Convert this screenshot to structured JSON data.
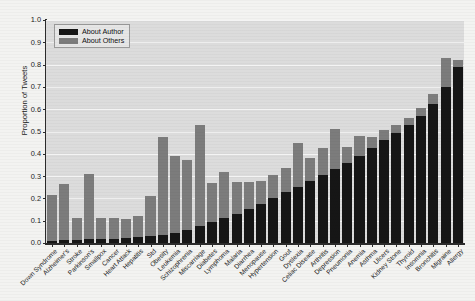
{
  "chart_data": {
    "type": "bar",
    "stacked": true,
    "title": "",
    "xlabel": "",
    "ylabel": "Proportion of Tweets",
    "ylim": [
      0.0,
      1.0
    ],
    "ytick_labels": [
      "0.0",
      "0.1",
      "0.2",
      "0.3",
      "0.4",
      "0.5",
      "0.6",
      "0.7",
      "0.8",
      "0.9",
      "1.0"
    ],
    "ytick_values": [
      0.0,
      0.1,
      0.2,
      0.3,
      0.4,
      0.5,
      0.6,
      0.7,
      0.8,
      0.9,
      1.0
    ],
    "grid": true,
    "legend_position": "upper left",
    "colors": {
      "about_author": "#161616",
      "about_others": "#7c7c7c",
      "plot_background": "#dcdcdc",
      "gridline": "#f4f4f4",
      "axis": "#2b2b2b",
      "figure_background": "#f3f3f1"
    },
    "categories": [
      "Down Syndrome",
      "Alzheimer's",
      "Stroke",
      "Parkinson's",
      "Smallpox",
      "Cancer",
      "Heart Attack",
      "Hepatitis",
      "Std",
      "Obesity",
      "Leukemia",
      "Schizophrenia",
      "Miscarriage",
      "Diabetes",
      "Lymphoma",
      "Malaria",
      "Diarrhea",
      "Menopause",
      "Hypertension",
      "Gout",
      "Dyslexia",
      "Celiac Disease",
      "Arthritis",
      "Depression",
      "Pneumonia",
      "Anemia",
      "Asthma",
      "Ulcers",
      "Kidney Stone",
      "Thyroid",
      "Insomnia",
      "Bronchitis",
      "Migraine",
      "Allergy"
    ],
    "series": [
      {
        "name": "About Author",
        "color": "#161616",
        "values": [
          0.01,
          0.013,
          0.014,
          0.016,
          0.018,
          0.02,
          0.022,
          0.025,
          0.03,
          0.037,
          0.047,
          0.06,
          0.075,
          0.092,
          0.11,
          0.13,
          0.152,
          0.175,
          0.2,
          0.227,
          0.252,
          0.278,
          0.305,
          0.332,
          0.36,
          0.392,
          0.425,
          0.46,
          0.495,
          0.53,
          0.57,
          0.625,
          0.7,
          0.79
        ]
      },
      {
        "name": "About Others",
        "color": "#7c7c7c",
        "values": [
          0.205,
          0.253,
          0.098,
          0.295,
          0.095,
          0.094,
          0.087,
          0.097,
          0.18,
          0.44,
          0.345,
          0.312,
          0.455,
          0.175,
          0.21,
          0.145,
          0.122,
          0.105,
          0.103,
          0.108,
          0.197,
          0.102,
          0.12,
          0.18,
          0.07,
          0.088,
          0.052,
          0.046,
          0.033,
          0.03,
          0.037,
          0.045,
          0.128,
          0.03
        ]
      }
    ],
    "totals": [
      0.215,
      0.266,
      0.112,
      0.311,
      0.113,
      0.114,
      0.109,
      0.122,
      0.21,
      0.477,
      0.392,
      0.372,
      0.53,
      0.267,
      0.32,
      0.275,
      0.274,
      0.28,
      0.303,
      0.335,
      0.449,
      0.38,
      0.425,
      0.512,
      0.43,
      0.48,
      0.477,
      0.506,
      0.528,
      0.56,
      0.607,
      0.67,
      0.828,
      0.82
    ]
  },
  "legend": {
    "items": [
      {
        "label": "About Author",
        "color": "#161616"
      },
      {
        "label": "About Others",
        "color": "#7c7c7c"
      }
    ]
  },
  "axes": {
    "y_title": "Proportion of Tweets"
  }
}
